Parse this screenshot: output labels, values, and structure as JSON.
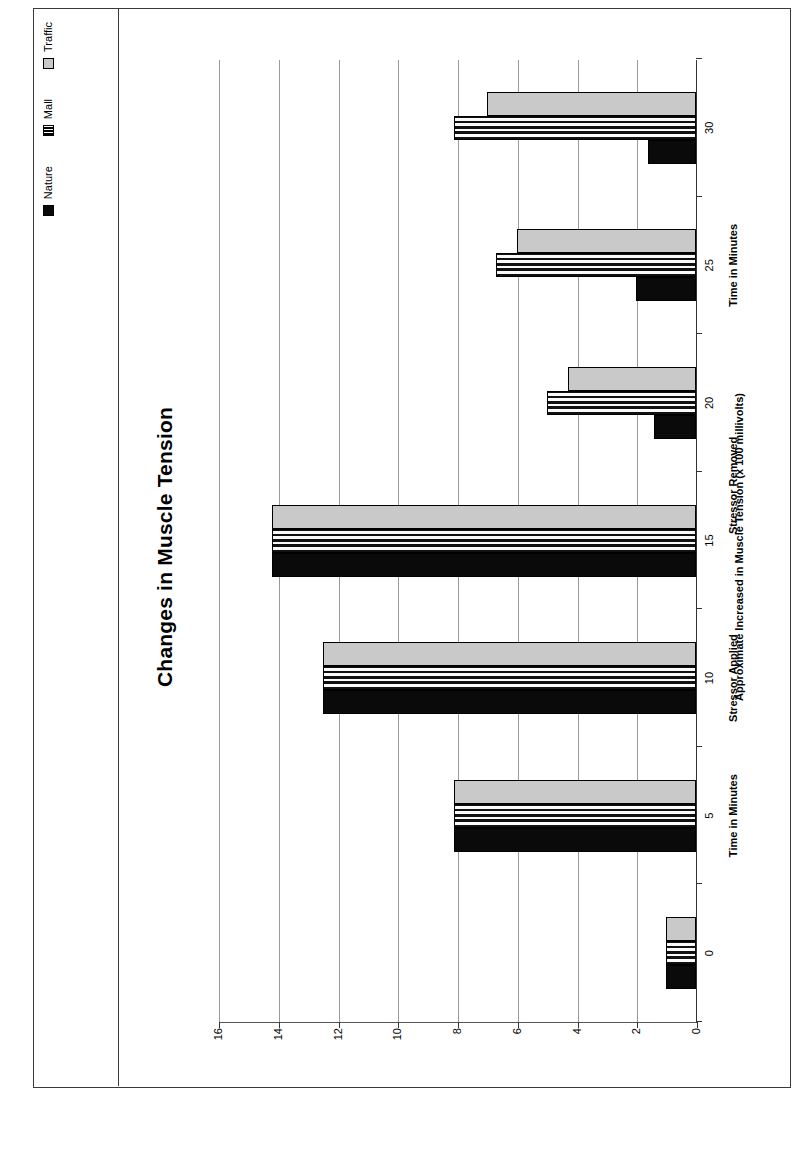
{
  "chart_data": {
    "type": "bar",
    "orientation": "vertical-rotated-90",
    "title": "Changes in Muscle Tension",
    "xlabel": "Time in Minutes",
    "ylabel": "Approximate Increased in Muscle Tension (x 100 millivolts)",
    "categories": [
      "0",
      "5",
      "10",
      "15",
      "20",
      "25",
      "30"
    ],
    "ylim": [
      0,
      16
    ],
    "yticks": [
      "0",
      "2",
      "4",
      "6",
      "8",
      "10",
      "12",
      "14",
      "16"
    ],
    "grid": true,
    "legend_position": "top-right",
    "series": [
      {
        "name": "Nature",
        "color": "#0a0a0a",
        "pattern": "solid",
        "values": [
          1.0,
          8.1,
          12.5,
          14.2,
          1.4,
          2.0,
          1.6
        ]
      },
      {
        "name": "Mall",
        "color": "#111111",
        "pattern": "stripes",
        "values": [
          1.0,
          8.1,
          12.5,
          14.2,
          5.0,
          6.7,
          8.1
        ]
      },
      {
        "name": "Traffic",
        "color": "#c9c9c9",
        "pattern": "solid",
        "values": [
          1.0,
          8.1,
          12.5,
          14.2,
          4.3,
          6.0,
          7.0
        ]
      }
    ],
    "annotations": [
      {
        "label": "Time in Minutes",
        "at_category": "5"
      },
      {
        "label": "Stressor Applied",
        "at_category": "10"
      },
      {
        "label": "Stressor Removed",
        "at_category": "17"
      },
      {
        "label": "Time in Minutes",
        "at_category": "25"
      }
    ]
  },
  "legend": {
    "items": [
      {
        "label": "Nature",
        "swatch": "nature-swatch"
      },
      {
        "label": "Mall",
        "swatch": "mall-swatch"
      },
      {
        "label": "Traffic",
        "swatch": "traffic-swatch"
      }
    ]
  }
}
